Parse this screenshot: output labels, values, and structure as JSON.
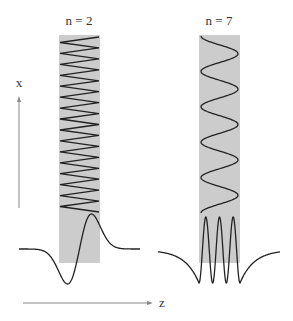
{
  "panels": [
    {
      "label": "n = 2",
      "mode_order": 2,
      "column": {
        "x": 59,
        "y": 35,
        "width": 41,
        "height": 228
      },
      "zigzag_periods": 16,
      "profile": "odd (antisymmetric), one lobe down, one lobe up"
    },
    {
      "label": "n = 7",
      "mode_order": 7,
      "column": {
        "x": 199,
        "y": 35,
        "width": 41,
        "height": 228
      },
      "zigzag_periods": 5,
      "profile": "even, multiple oscillations inside core with evanescent tails"
    }
  ],
  "axes": {
    "x_label": "x",
    "z_label": "z"
  },
  "colors": {
    "core": "#cccccc",
    "curve": "#222222",
    "axis": "#888888"
  }
}
